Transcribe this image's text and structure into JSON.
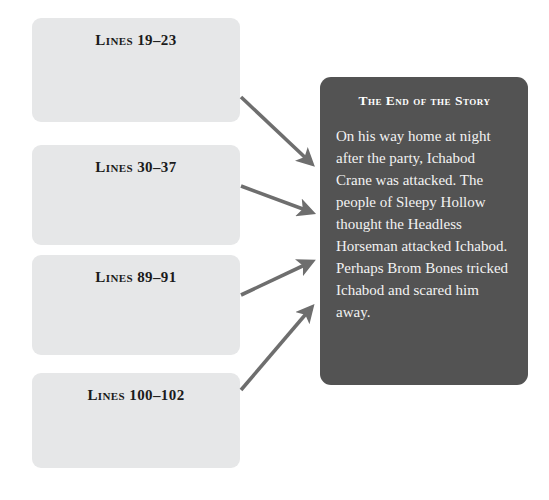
{
  "colors": {
    "page_background": "#ffffff",
    "source_box_fill": "#e6e7e8",
    "source_box_text": "#1b1b1b",
    "panel_fill": "#535353",
    "panel_heading_text": "#ffffff",
    "panel_body_text": "#f2f2f2",
    "arrow": "#6e6e6e"
  },
  "source_boxes": [
    {
      "label": "Lines 19–23"
    },
    {
      "label": "Lines 30–37"
    },
    {
      "label": "Lines 89–91"
    },
    {
      "label": "Lines 100–102"
    }
  ],
  "summary_panel": {
    "heading": "The End of the Story",
    "body": "On his way home at night after the party, Ichabod Crane was attacked. The people of Sleepy Hollow thought the Headless Horseman attacked Ichabod. Perhaps Brom Bones tricked Ichabod and scared him away."
  },
  "arrows": [
    {
      "from": "Lines 19–23",
      "to": "The End of the Story",
      "direction": "down-right"
    },
    {
      "from": "Lines 30–37",
      "to": "The End of the Story",
      "direction": "down-right"
    },
    {
      "from": "Lines 89–91",
      "to": "The End of the Story",
      "direction": "up-right"
    },
    {
      "from": "Lines 100–102",
      "to": "The End of the Story",
      "direction": "up-right"
    }
  ]
}
